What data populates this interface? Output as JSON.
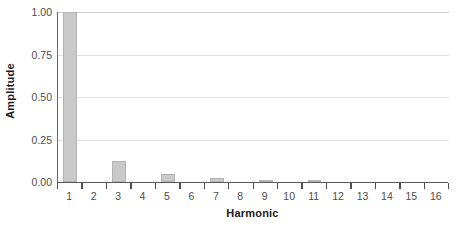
{
  "chart_data": {
    "type": "bar",
    "title": "",
    "xlabel": "Harmonic",
    "ylabel": "Amplitude",
    "categories": [
      "1",
      "2",
      "3",
      "4",
      "5",
      "6",
      "7",
      "8",
      "9",
      "10",
      "11",
      "12",
      "13",
      "14",
      "15",
      "16"
    ],
    "values": [
      1.0,
      0.0,
      0.125,
      0.0,
      0.045,
      0.0,
      0.022,
      0.0,
      0.014,
      0.0,
      0.008,
      0.0,
      0.0,
      0.0,
      0.0,
      0.0
    ],
    "ylim": [
      0.0,
      1.0
    ],
    "ytick_labels": [
      "0.00",
      "0.25",
      "0.50",
      "0.75",
      "1.00"
    ],
    "ytick_values": [
      0.0,
      0.25,
      0.5,
      0.75,
      1.0
    ],
    "grid": true,
    "legend": null,
    "bar_color": "#c9c9c9",
    "bar_border_color": "#b3b3b3",
    "gridline_color": "#e2e2e2",
    "axis_color": "#5a5a5a",
    "tick_label_color": "#4d4d4d",
    "axis_title_color": "#1c1c1c"
  }
}
